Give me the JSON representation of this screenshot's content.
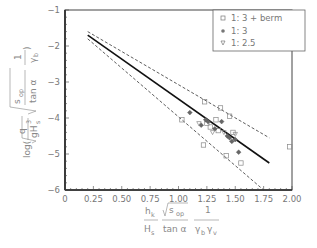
{
  "chart_data": {
    "type": "scatter",
    "title": "",
    "xlabel": "h_k / H_s · sqrt(s_op) / tan α · 1 / (γ_b γ_v)",
    "ylabel": "log( q / sqrt(g H_s^3) · sqrt(s_op / tan α) · 1 / γ_b )",
    "xlim": [
      0,
      2.0
    ],
    "ylim": [
      -6,
      -1
    ],
    "x_ticks": [
      "0",
      "0.25",
      "0.50",
      "0.75",
      "1.00",
      "1.25",
      "1.50",
      "1.75",
      "2.00"
    ],
    "y_ticks": [
      "-1",
      "-2",
      "-3",
      "-4",
      "-5",
      "-6"
    ],
    "grid": false,
    "legend_position": "upper right",
    "legend": [
      {
        "label": "1:3 + berm",
        "marker": "square"
      },
      {
        "label": "1:3",
        "marker": "filled-diamond"
      },
      {
        "label": "1:2.5",
        "marker": "triangle-down"
      }
    ],
    "series": [
      {
        "name": "1:3 + berm",
        "marker": "square",
        "points": [
          [
            1.23,
            -3.55
          ],
          [
            1.37,
            -3.72
          ],
          [
            1.25,
            -4.15
          ],
          [
            1.03,
            -4.05
          ],
          [
            1.33,
            -4.05
          ],
          [
            1.45,
            -3.95
          ],
          [
            1.22,
            -4.75
          ],
          [
            1.42,
            -5.05
          ],
          [
            1.55,
            -5.25
          ],
          [
            1.48,
            -4.4
          ],
          [
            1.98,
            -4.8
          ],
          [
            1.35,
            -4.35
          ],
          [
            1.28,
            -4.25
          ]
        ]
      },
      {
        "name": "1:3",
        "marker": "filled-diamond",
        "points": [
          [
            1.1,
            -3.85
          ],
          [
            1.2,
            -4.2
          ],
          [
            1.26,
            -4.1
          ],
          [
            1.32,
            -4.3
          ],
          [
            1.38,
            -4.1
          ],
          [
            1.43,
            -4.5
          ],
          [
            1.45,
            -4.55
          ],
          [
            1.47,
            -4.65
          ],
          [
            1.5,
            -4.6
          ],
          [
            1.53,
            -4.95
          ],
          [
            1.24,
            -4.05
          ]
        ]
      },
      {
        "name": "1:2.5",
        "marker": "triangle-down",
        "points": [
          [
            1.18,
            -4.15
          ],
          [
            1.3,
            -4.4
          ],
          [
            1.4,
            -4.4
          ],
          [
            1.5,
            -4.45
          ]
        ]
      }
    ],
    "lines": [
      {
        "name": "fit",
        "style": "solid",
        "x": [
          0.2,
          1.8
        ],
        "y": [
          -1.7,
          -5.25
        ]
      },
      {
        "name": "upper-bound",
        "style": "dashed",
        "x": [
          0.2,
          1.8
        ],
        "y": [
          -1.6,
          -4.55
        ]
      },
      {
        "name": "lower-bound",
        "style": "dashed",
        "x": [
          0.2,
          1.75
        ],
        "y": [
          -1.8,
          -6.0
        ]
      }
    ]
  },
  "labels": {
    "y_tick": [
      "-1",
      "-2",
      "-3",
      "-4",
      "-5",
      "-6"
    ],
    "x_tick": [
      "0",
      "0.25",
      "0.50",
      "0.75",
      "1.00",
      "1.25",
      "1.50",
      "1.75",
      "2.00"
    ],
    "legend": [
      "1: 3  +  berm",
      "1: 3",
      "1: 2.5"
    ],
    "xlabel": {
      "hk": "h",
      "hk_sub": "k",
      "Hs": "H",
      "Hs_sub": "s",
      "sqrt_s": "s",
      "sqrt_s_sub": "op",
      "tan": "tan α",
      "one": "1",
      "gammas": "γ",
      "gb_sub": "b",
      "gv": "γ",
      "gv_sub": "v"
    },
    "ylabel": {
      "log": "log(",
      "q": "q",
      "g": "gH",
      "g_sub": "s",
      "g_sup": "3",
      "s": "s",
      "s_sub": "op",
      "tan": "tan α",
      "one": "1",
      "gamma": "γ",
      "gamma_sub": "b",
      "close": ")"
    }
  }
}
